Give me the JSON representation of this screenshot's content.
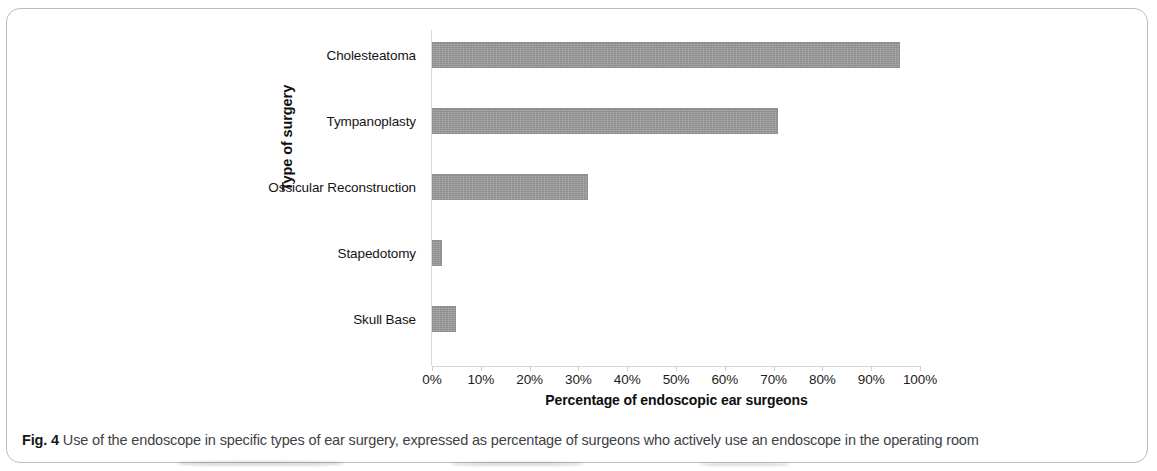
{
  "figure": {
    "caption_label": "Fig. 4",
    "caption_text": " Use of the endoscope in specific types of ear surgery, expressed as percentage of surgeons who actively use an endoscope in the operating room"
  },
  "chart_data": {
    "type": "bar",
    "orientation": "horizontal",
    "title": "",
    "categories": [
      "Cholesteatoma",
      "Tympanoplasty",
      "Ossicular Reconstruction",
      "Stapedotomy",
      "Skull Base"
    ],
    "values": [
      96,
      71,
      32,
      2,
      5
    ],
    "xlabel": "Percentage of endoscopic ear surgeons",
    "ylabel": "Type of surgery",
    "xlim": [
      0,
      100
    ],
    "xticks": [
      0,
      10,
      20,
      30,
      40,
      50,
      60,
      70,
      80,
      90,
      100
    ],
    "xtick_labels": [
      "0%",
      "10%",
      "20%",
      "30%",
      "40%",
      "50%",
      "60%",
      "70%",
      "80%",
      "90%",
      "100%"
    ],
    "grid": false,
    "legend": false,
    "series_color": "#9a9a9a"
  }
}
